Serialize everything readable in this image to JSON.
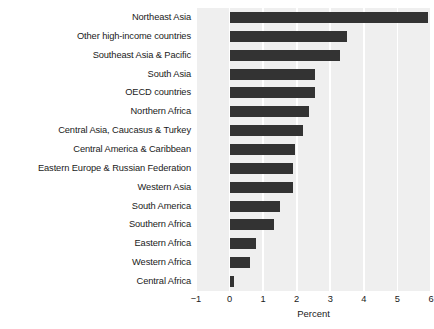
{
  "chart_data": {
    "type": "bar",
    "orientation": "horizontal",
    "title": "",
    "xlabel": "Percent",
    "ylabel": "",
    "xlim": [
      -1,
      6
    ],
    "xticks": [
      -1,
      0,
      1,
      2,
      3,
      4,
      5,
      6
    ],
    "xtick_labels": [
      "−1",
      "0",
      "1",
      "2",
      "3",
      "4",
      "5",
      "6"
    ],
    "grid": "vertical-white-gridlines",
    "legend": "none",
    "bar_color": "#333333",
    "plot_background": "#efefef",
    "gridline_color": "#ffffff",
    "categories": [
      "Northeast Asia",
      "Other high-income countries",
      "Southeast Asia & Pacific",
      "South Asia",
      "OECD countries",
      "Northern Africa",
      "Central Asia, Caucasus & Turkey",
      "Central America & Caribbean",
      "Eastern Europe & Russian Federation",
      "Western Asia",
      "South America",
      "Southern Africa",
      "Eastern Africa",
      "Western Africa",
      "Central Africa"
    ],
    "values": [
      5.9,
      3.5,
      3.3,
      2.55,
      2.55,
      2.38,
      2.2,
      1.95,
      1.9,
      1.9,
      1.5,
      1.32,
      0.8,
      0.6,
      0.12
    ]
  }
}
